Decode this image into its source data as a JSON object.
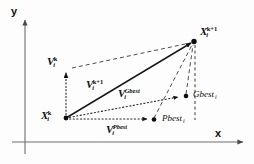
{
  "figure": {
    "background_color": "#fdfdfd",
    "ink_color": "#101010"
  },
  "axes": {
    "x_label": "x",
    "y_label": "y",
    "x_axis_color": "#6e6e6e",
    "y_axis_color": "#6e6e6e",
    "origin_px": {
      "x": 25,
      "y": 142
    }
  },
  "nodes": [
    {
      "id": "x-current",
      "name": "X_i^k",
      "base": "X",
      "sub": "i",
      "sup": "k",
      "point_px": {
        "x": 66,
        "y": 118
      }
    },
    {
      "id": "x-next",
      "name": "X_i^k+1",
      "base": "X",
      "sub": "i",
      "sup": "k+1",
      "point_px": {
        "x": 194,
        "y": 41
      }
    },
    {
      "id": "gbest",
      "name": "Gbest_i",
      "base": "Gbest",
      "sub": "i",
      "point_px": {
        "x": 186,
        "y": 96
      }
    },
    {
      "id": "pbest",
      "name": "Pbest_i",
      "base": "Pbest",
      "sub": "i",
      "point_px": {
        "x": 154,
        "y": 120
      }
    },
    {
      "id": "v-current-tip",
      "name": "V_i^k arrow tip",
      "base": "V",
      "sub": "i",
      "sup": "k",
      "point_px": {
        "x": 66,
        "y": 70
      }
    }
  ],
  "vectors": [
    {
      "id": "v-current",
      "base": "V",
      "sub": "i",
      "sup": "k",
      "sup_italic": false,
      "label_px": {
        "x": 47,
        "y": 56
      },
      "style": "dotted"
    },
    {
      "id": "v-next",
      "base": "V",
      "sub": "i",
      "sup": "k+1",
      "sup_italic": false,
      "label_px": {
        "x": 86,
        "y": 79
      },
      "style": "solid"
    },
    {
      "id": "v-gbest",
      "base": "V",
      "sub": "i",
      "sup": "Gbest",
      "sup_italic": true,
      "label_px": {
        "x": 118,
        "y": 88
      },
      "style": "dotted"
    },
    {
      "id": "v-pbest",
      "base": "V",
      "sub": "i",
      "sup": "Pbest",
      "sup_italic": true,
      "label_px": {
        "x": 106,
        "y": 124
      },
      "style": "dotted"
    }
  ],
  "node_labels": [
    {
      "id": "x-current-label",
      "base": "X",
      "sub": "i",
      "sup": "k",
      "label_px": {
        "x": 41,
        "y": 110
      }
    },
    {
      "id": "x-next-label",
      "base": "X",
      "sub": "i",
      "sup": "k+1",
      "label_px": {
        "x": 200,
        "y": 26
      }
    },
    {
      "id": "gbest-label",
      "base": "Gbest",
      "sub": "i",
      "label_px": {
        "x": 196,
        "y": 90
      }
    },
    {
      "id": "pbest-label",
      "base": "Pbest",
      "sub": "i",
      "label_px": {
        "x": 165,
        "y": 114
      }
    }
  ]
}
